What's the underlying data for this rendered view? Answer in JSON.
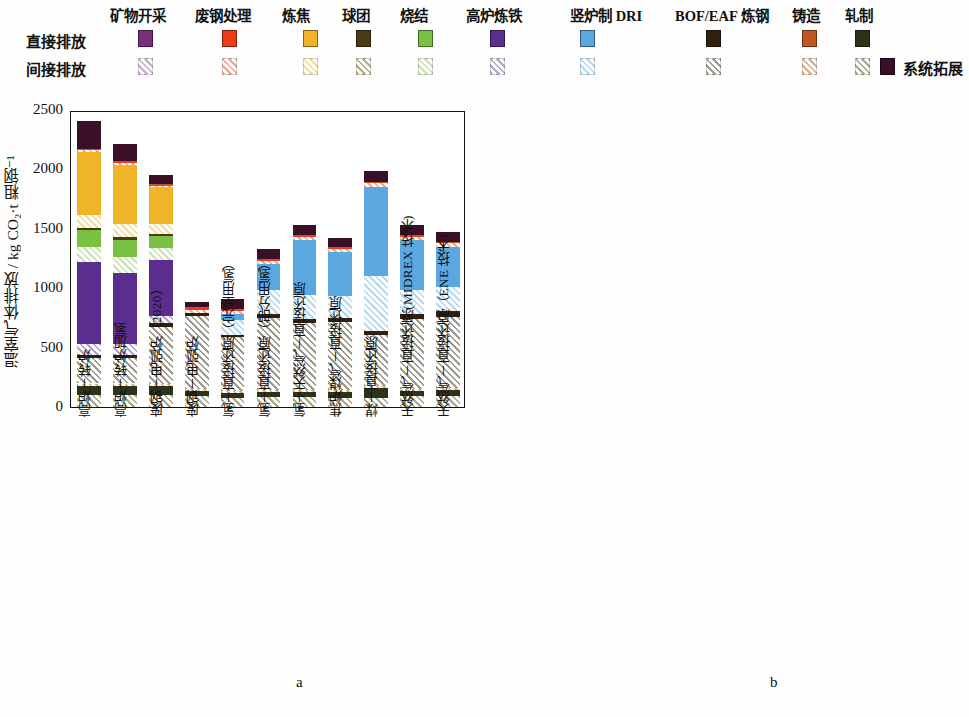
{
  "legend": {
    "row_labels": [
      "直接排放",
      "间接排放"
    ],
    "system_extension": "系统拓展",
    "system_extension_color": "#3a1028",
    "categories": [
      {
        "name": "矿物开采",
        "direct": "#7b2d7e",
        "indirect": "#c9a8d4"
      },
      {
        "name": "废钢处理",
        "direct": "#f03a16",
        "indirect": "#f5a494"
      },
      {
        "name": "炼焦",
        "direct": "#f0b429",
        "indirect": "#f3dc9a"
      },
      {
        "name": "球团",
        "direct": "#4a3b12",
        "indirect": "#b6ad86"
      },
      {
        "name": "烧结",
        "direct": "#7ac143",
        "indirect": "#c7e3ae"
      },
      {
        "name": "高炉炼铁",
        "direct": "#5b2d8e",
        "indirect": "#b0a6d6"
      },
      {
        "name": "竖炉制 DRI",
        "direct": "#5ba7e0",
        "indirect": "#b4d9f2"
      },
      {
        "name": "BOF/EAF 炼钢",
        "direct": "#32200f",
        "indirect": "#9e9a8e"
      },
      {
        "name": "铸造",
        "direct": "#c2561f",
        "indirect": "#e2a87e"
      },
      {
        "name": "轧制",
        "direct": "#2b3318",
        "indirect": "#a9a98a"
      }
    ]
  },
  "panel_letters": {
    "a": "a",
    "b": "b"
  },
  "x_categories": [
    "高炉－转炉",
    "高炉－转炉加氢",
    "废钢－电弧炉（2020）",
    "废钢－电弧炉",
    "氢－直接还原（完全用氢）",
    "氢－直接还原（部分用氢）",
    "氢＋天然气－直接还原",
    "焦炉煤气－直接还原",
    "煤－直接还原",
    "天然气－直接还原(MIDREX 技术)",
    "天然气－直接还原（ENE 技术）"
  ],
  "chart_data": [
    {
      "type": "bar",
      "stacked": true,
      "panel": "a",
      "title": "",
      "xlabel": "",
      "ylabel": "温室气体排放 / kg CO₂·t 粗钢⁻¹",
      "ylim": [
        0,
        2500
      ],
      "yticks": [
        0,
        500,
        1000,
        1500,
        2000,
        2500
      ],
      "ytick_labels": [
        "0",
        "500",
        "1000",
        "1500",
        "2000",
        "2500"
      ],
      "grid": false,
      "legend_position": "top",
      "categories": [
        "高炉－转炉",
        "高炉－转炉加氢",
        "废钢－电弧炉（2020）",
        "废钢－电弧炉",
        "氢－直接还原（完全用氢）",
        "氢－直接还原（部分用氢）",
        "氢＋天然气－直接还原",
        "焦炉煤气－直接还原",
        "煤－直接还原",
        "天然气－直接还原(MIDREX 技术)",
        "天然气－直接还原（ENE 技术）"
      ],
      "totals": [
        2410,
        2210,
        1805,
        880,
        930,
        1330,
        1510,
        1400,
        1990,
        1580,
        1500
      ],
      "series": [
        {
          "name": "矿物开采-间接",
          "key": "mining_ind",
          "color": "#c9a8d4",
          "hatch": true,
          "values": [
            0,
            0,
            0,
            0,
            0,
            0,
            0,
            0,
            0,
            0,
            0
          ]
        },
        {
          "name": "轧制-间接",
          "key": "rolling_ind",
          "color": "#a9a98a",
          "hatch": true,
          "values": [
            105,
            105,
            100,
            95,
            75,
            85,
            85,
            80,
            80,
            90,
            95
          ]
        },
        {
          "name": "轧制-直接",
          "key": "rolling_dir",
          "color": "#2b3318",
          "hatch": false,
          "values": [
            75,
            75,
            75,
            40,
            42,
            45,
            45,
            45,
            80,
            45,
            45
          ]
        },
        {
          "name": "铸造-间接",
          "key": "casting_ind",
          "color": "#e2a87e",
          "hatch": true,
          "values": [
            18,
            18,
            18,
            15,
            14,
            16,
            16,
            15,
            16,
            16,
            16
          ]
        },
        {
          "name": "BOF/EAF炼钢-间接",
          "key": "steel_ind",
          "color": "#9e9a8e",
          "hatch": true,
          "values": [
            215,
            215,
            480,
            620,
            455,
            600,
            560,
            575,
            430,
            590,
            600
          ]
        },
        {
          "name": "BOF/EAF炼钢-直接",
          "key": "steel_dir",
          "color": "#32200f",
          "hatch": false,
          "values": [
            22,
            22,
            32,
            18,
            20,
            38,
            38,
            38,
            30,
            45,
            50
          ]
        },
        {
          "name": "高炉炼铁-间接",
          "key": "bf_ind",
          "color": "#b0a6d6",
          "hatch": true,
          "values": [
            95,
            95,
            60,
            0,
            0,
            0,
            0,
            0,
            0,
            0,
            0
          ]
        },
        {
          "name": "高炉炼铁-直接",
          "key": "bf_dir",
          "color": "#5b2d8e",
          "hatch": false,
          "values": [
            690,
            600,
            475,
            0,
            0,
            0,
            0,
            0,
            0,
            0,
            0
          ]
        },
        {
          "name": "竖炉制DRI-间接",
          "key": "dri_ind",
          "color": "#b4d9f2",
          "hatch": true,
          "values": [
            0,
            0,
            0,
            0,
            130,
            200,
            200,
            185,
            470,
            200,
            205
          ]
        },
        {
          "name": "竖炉制DRI-直接",
          "key": "dri_dir",
          "color": "#5ba7e0",
          "hatch": false,
          "values": [
            0,
            0,
            0,
            0,
            45,
            220,
            465,
            370,
            750,
            420,
            340
          ]
        },
        {
          "name": "烧结-间接",
          "key": "sinter_ind",
          "color": "#c7e3ae",
          "hatch": true,
          "values": [
            125,
            135,
            95,
            0,
            0,
            0,
            0,
            0,
            0,
            0,
            0
          ]
        },
        {
          "name": "烧结-直接",
          "key": "sinter_dir",
          "color": "#7ac143",
          "hatch": false,
          "values": [
            145,
            145,
            105,
            0,
            0,
            0,
            0,
            0,
            0,
            0,
            0
          ]
        },
        {
          "name": "球团-直接",
          "key": "pellet_dir",
          "color": "#4a3b12",
          "hatch": false,
          "values": [
            18,
            18,
            18,
            0,
            0,
            0,
            0,
            0,
            0,
            0,
            0
          ]
        },
        {
          "name": "炼焦-间接",
          "key": "coking_ind",
          "color": "#f3dc9a",
          "hatch": true,
          "values": [
            105,
            110,
            80,
            0,
            0,
            0,
            0,
            0,
            0,
            0,
            0
          ]
        },
        {
          "name": "炼焦-直接",
          "key": "coking_dir",
          "color": "#f0b429",
          "hatch": false,
          "values": [
            530,
            500,
            310,
            0,
            0,
            0,
            0,
            0,
            0,
            0,
            0
          ]
        },
        {
          "name": "废钢处理-间接",
          "key": "scrap_ind",
          "color": "#f5a494",
          "hatch": true,
          "values": [
            20,
            20,
            15,
            28,
            25,
            26,
            26,
            25,
            26,
            26,
            26
          ]
        },
        {
          "name": "废钢处理-直接",
          "key": "scrap_dir",
          "color": "#f03a16",
          "hatch": false,
          "values": [
            6,
            6,
            6,
            20,
            14,
            10,
            10,
            10,
            10,
            10,
            10
          ]
        },
        {
          "name": "铸造-直接",
          "key": "casting_dir",
          "color": "#c2561f",
          "hatch": false,
          "values": [
            6,
            6,
            6,
            6,
            6,
            6,
            6,
            6,
            6,
            6,
            6
          ]
        },
        {
          "name": "系统拓展",
          "key": "sys_ext",
          "color": "#3a1028",
          "hatch": false,
          "values": [
            235,
            140,
            80,
            38,
            84,
            84,
            84,
            76,
            92,
            82,
            77
          ]
        }
      ]
    },
    {
      "type": "bar",
      "stacked": true,
      "panel": "b",
      "title": "",
      "xlabel": "",
      "ylabel": "温室气体排放占比 / %",
      "ylim": [
        0,
        100
      ],
      "yticks": [
        0,
        10,
        20,
        30,
        40,
        50,
        60,
        70,
        80,
        90,
        100
      ],
      "ytick_labels": [
        "0",
        "10",
        "20",
        "30",
        "40",
        "50",
        "60",
        "70",
        "80",
        "90",
        "100"
      ],
      "grid": false,
      "legend_position": "top",
      "categories": [
        "高炉－转炉",
        "高炉－转炉加氢",
        "废钢－电弧炉（2020）",
        "废钢－电弧炉",
        "氢－直接还原（完全用氢）",
        "氢－直接还原（部分用氢）",
        "氢＋天然气－直接还原",
        "焦炉煤气－直接还原",
        "煤－直接还原",
        "天然气－直接还原(MIDREX 技术)",
        "天然气－直接还原（ENE 技术）"
      ],
      "series": [
        {
          "name": "轧制-间接",
          "key": "rolling_ind",
          "color": "#a9a98a",
          "hatch": true,
          "values": [
            3.3,
            3.5,
            3.0,
            7.0,
            5.0,
            5.0,
            4.6,
            4.7,
            3.0,
            5.0,
            5.3
          ]
        },
        {
          "name": "轧制-直接",
          "key": "rolling_dir",
          "color": "#2b3318",
          "hatch": false,
          "values": [
            4.8,
            4.9,
            5.0,
            6.5,
            5.5,
            5.3,
            4.9,
            4.9,
            6.0,
            5.0,
            5.2
          ]
        },
        {
          "name": "铸造-间接",
          "key": "casting_ind",
          "color": "#e2a87e",
          "hatch": true,
          "values": [
            1.0,
            1.0,
            1.0,
            1.7,
            1.5,
            1.2,
            1.1,
            1.1,
            0.8,
            1.0,
            1.1
          ]
        },
        {
          "name": "BOF/EAF炼钢-间接",
          "key": "steel_ind",
          "color": "#9e9a8e",
          "hatch": true,
          "values": [
            8.0,
            8.0,
            26.0,
            68.0,
            44.0,
            44.0,
            36.5,
            38.0,
            21.0,
            36.0,
            31.0
          ]
        },
        {
          "name": "BOF/EAF炼钢-直接",
          "key": "steel_dir",
          "color": "#32200f",
          "hatch": false,
          "values": [
            1.0,
            1.0,
            2.0,
            2.0,
            2.0,
            2.8,
            2.6,
            2.7,
            1.5,
            3.0,
            3.4
          ]
        },
        {
          "name": "高炉炼铁-间接",
          "key": "bf_ind",
          "color": "#b0a6d6",
          "hatch": true,
          "values": [
            3.7,
            3.6,
            2.5,
            0,
            0,
            0,
            0,
            0,
            0,
            0,
            0
          ]
        },
        {
          "name": "高炉炼铁-直接",
          "key": "bf_dir",
          "color": "#5b2d8e",
          "hatch": false,
          "values": [
            28.8,
            27.8,
            22.0,
            0,
            0,
            0,
            0,
            0,
            0,
            0,
            0
          ]
        },
        {
          "name": "竖炉制DRI-间接",
          "key": "dri_ind",
          "color": "#b4d9f2",
          "hatch": true,
          "values": [
            0,
            0,
            0,
            0,
            17.0,
            15.0,
            13.5,
            13.5,
            24.0,
            13.5,
            14.0
          ]
        },
        {
          "name": "竖炉制DRI-直接",
          "key": "dri_dir",
          "color": "#5ba7e0",
          "hatch": false,
          "values": [
            0,
            0,
            0,
            0,
            14.0,
            17.0,
            30.0,
            26.5,
            37.0,
            28.0,
            30.0
          ]
        },
        {
          "name": "烧结-间接",
          "key": "sinter_ind",
          "color": "#c7e3ae",
          "hatch": true,
          "values": [
            4.8,
            5.2,
            5.5,
            0,
            0,
            0,
            0,
            0,
            0,
            0,
            0
          ]
        },
        {
          "name": "烧结-直接",
          "key": "sinter_dir",
          "color": "#7ac143",
          "hatch": false,
          "values": [
            9.0,
            9.2,
            5.5,
            0,
            0,
            0,
            0,
            0,
            0,
            0,
            0
          ]
        },
        {
          "name": "球团-直接",
          "key": "pellet_dir",
          "color": "#4a3b12",
          "hatch": false,
          "values": [
            0.8,
            0.8,
            0.8,
            0,
            0,
            0,
            0,
            0,
            0,
            0,
            0
          ]
        },
        {
          "name": "炼焦-间接",
          "key": "coking_ind",
          "color": "#f3dc9a",
          "hatch": true,
          "values": [
            4.4,
            4.5,
            4.0,
            0,
            0,
            0,
            0,
            0,
            0,
            0,
            0
          ]
        },
        {
          "name": "炼焦-直接",
          "key": "coking_dir",
          "color": "#f0b429",
          "hatch": false,
          "values": [
            21.0,
            21.5,
            17.0,
            0,
            0,
            0,
            0,
            0,
            0,
            0,
            0
          ]
        },
        {
          "name": "废钢处理-间接",
          "key": "scrap_ind",
          "color": "#f5a494",
          "hatch": true,
          "values": [
            0.8,
            0.8,
            0.9,
            3.5,
            2.0,
            1.7,
            1.6,
            1.5,
            1.5,
            1.6,
            1.7
          ]
        },
        {
          "name": "废钢处理-直接",
          "key": "scrap_dir",
          "color": "#f03a16",
          "hatch": false,
          "values": [
            0.3,
            0.3,
            0.3,
            2.3,
            1.0,
            0.8,
            0.7,
            0.7,
            0.7,
            0.7,
            0.8
          ]
        },
        {
          "name": "铸造-直接",
          "key": "casting_dir",
          "color": "#c2561f",
          "hatch": false,
          "values": [
            0.3,
            0.3,
            0.3,
            0.5,
            0.5,
            0.4,
            0.4,
            0.4,
            0.3,
            0.4,
            0.4
          ]
        },
        {
          "name": "系统拓展",
          "key": "sys_ext",
          "color": "#3a1028",
          "hatch": false,
          "values": [
            8.0,
            8.0,
            4.2,
            8.5,
            7.5,
            6.8,
            4.6,
            6.0,
            4.7,
            5.8,
            7.1
          ]
        }
      ]
    }
  ]
}
